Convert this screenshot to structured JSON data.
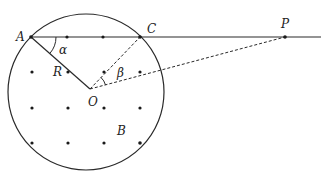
{
  "diagram": {
    "colors": {
      "stroke": "#2a2a2a",
      "background": "#ffffff"
    },
    "circle": {
      "cx": 86,
      "cy": 92,
      "r": 78
    },
    "points": {
      "A": {
        "x": 31,
        "y": 37
      },
      "C": {
        "x": 140,
        "y": 37
      },
      "O": {
        "x": 90,
        "y": 89
      },
      "P": {
        "x": 285,
        "y": 37
      },
      "R": {
        "x": 68,
        "y": 72
      },
      "Q": {
        "x": 104,
        "y": 72
      }
    },
    "lattice": [
      [
        31,
        37
      ],
      [
        67,
        37
      ],
      [
        103,
        37
      ],
      [
        140,
        37
      ],
      [
        32,
        72
      ],
      [
        68,
        72
      ],
      [
        104,
        72
      ],
      [
        140,
        72
      ],
      [
        32,
        108
      ],
      [
        68,
        108
      ],
      [
        104,
        108
      ],
      [
        140,
        108
      ],
      [
        32,
        143
      ],
      [
        68,
        143
      ],
      [
        104,
        143
      ],
      [
        140,
        143
      ]
    ],
    "labels": {
      "A": "A",
      "C": "C",
      "P": "P",
      "R": "R",
      "O": "O",
      "B": "B",
      "alpha": "α",
      "beta": "β"
    }
  }
}
